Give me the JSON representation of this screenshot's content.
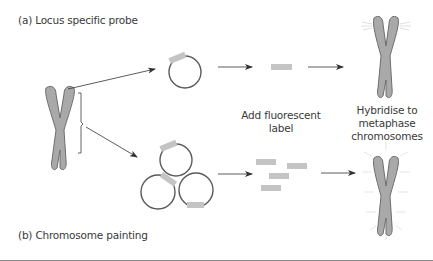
{
  "title_a": "(a) Locus specific probe",
  "title_b": "(b) Chromosome painting",
  "step_label_1": "Add fluorescent label",
  "step_label_2": "Hybridise to metaphase chromosomes",
  "colors": {
    "chromosome_fill": "#a9a9a9",
    "chromosome_stroke": "#6e6e6e",
    "probe_fill": "#c4c4c4",
    "circle_stroke": "#5a5a5a",
    "arrow": "#333333",
    "rule": "#8a8a8a"
  },
  "diagram": {
    "panel_a": {
      "source": "chromosome",
      "vector": "single plasmid circle with one probe insert",
      "labeled_probe_count": 1,
      "result": "metaphase chromosome with fluorescent signal at tips"
    },
    "panel_b": {
      "source": "chromosome region (bracketed)",
      "vector": "three plasmid circles each with insert",
      "labeled_probe_count": 4,
      "result": "metaphase chromosome painted along whole length"
    }
  }
}
